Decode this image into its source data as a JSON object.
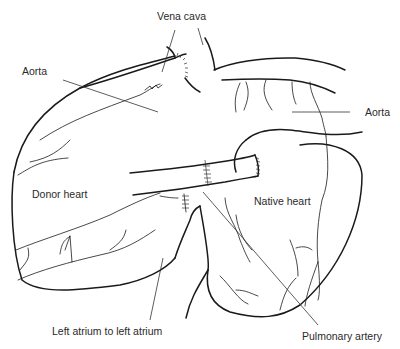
{
  "diagram": {
    "type": "anatomical-line-drawing",
    "labels": {
      "vena_cava": "Vena cava",
      "aorta_left": "Aorta",
      "aorta_right": "Aorta",
      "donor_heart": "Donor heart",
      "native_heart": "Native heart",
      "left_atrium": "Left atrium to left atrium",
      "pulmonary_artery": "Pulmonary artery"
    },
    "colors": {
      "line": "#1a1a1a",
      "background": "#ffffff",
      "text": "#2a2a2a"
    }
  }
}
